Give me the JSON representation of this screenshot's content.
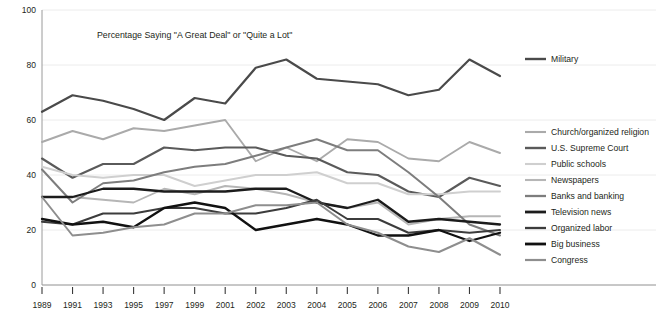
{
  "chart_data": {
    "type": "line",
    "title": "Percentage Saying \"A Great Deal\" or \"Quite a Lot\"",
    "xlabel": "",
    "ylabel": "",
    "ylim": [
      0,
      100
    ],
    "yticks": [
      0,
      20,
      40,
      60,
      80,
      100
    ],
    "grid": true,
    "legend_position": "right",
    "x": [
      "1989",
      "1991",
      "1993",
      "1995",
      "1997",
      "1999",
      "2001",
      "2002",
      "2003",
      "2004",
      "2005",
      "2006",
      "2007",
      "2008",
      "2009",
      "2010"
    ],
    "categories": [
      "1989",
      "1991",
      "1993",
      "1995",
      "1997",
      "1999",
      "2001",
      "2002",
      "2003",
      "2004",
      "2005",
      "2006",
      "2007",
      "2008",
      "2009",
      "2010"
    ],
    "series": [
      {
        "name": "Military",
        "color": "#4a4a4a",
        "width": 2.2,
        "values": [
          63,
          69,
          67,
          64,
          60,
          68,
          66,
          79,
          82,
          75,
          74,
          73,
          69,
          71,
          82,
          76
        ]
      },
      {
        "name": "Church/organized religion",
        "color": "#aaaaaa",
        "width": 1.9,
        "values": [
          52,
          56,
          53,
          57,
          56,
          58,
          60,
          45,
          50,
          45,
          53,
          52,
          46,
          45,
          52,
          48
        ]
      },
      {
        "name": "U.S. Supreme Court",
        "color": "#5a5a5a",
        "width": 2.1,
        "values": [
          46,
          39,
          44,
          44,
          50,
          49,
          50,
          50,
          47,
          46,
          41,
          40,
          34,
          32,
          39,
          36
        ]
      },
      {
        "name": "Public schools",
        "color": "#cfcfcf",
        "width": 1.9,
        "values": [
          43,
          40,
          39,
          40,
          40,
          36,
          38,
          40,
          40,
          41,
          37,
          37,
          33,
          33,
          34,
          34
        ]
      },
      {
        "name": "Newspapers",
        "color": "#b6b6b6",
        "width": 1.9,
        "values": [
          32,
          32,
          31,
          30,
          35,
          33,
          36,
          35,
          33,
          30,
          28,
          30,
          22,
          24,
          25,
          25
        ]
      },
      {
        "name": "Banks and banking",
        "color": "#7d7d7d",
        "width": 2.0,
        "values": [
          42,
          30,
          37,
          38,
          41,
          43,
          44,
          47,
          50,
          53,
          49,
          49,
          41,
          32,
          22,
          18
        ]
      },
      {
        "name": "Television news",
        "color": "#1c1c1c",
        "width": 2.3,
        "values": [
          32,
          32,
          35,
          35,
          34,
          34,
          34,
          35,
          35,
          30,
          28,
          31,
          23,
          24,
          23,
          22
        ]
      },
      {
        "name": "Organized labor",
        "color": "#3c3c3c",
        "width": 2.0,
        "values": [
          23,
          22,
          26,
          26,
          28,
          28,
          26,
          26,
          28,
          31,
          24,
          24,
          19,
          20,
          19,
          20
        ]
      },
      {
        "name": "Big business",
        "color": "#111111",
        "width": 2.3,
        "values": [
          24,
          22,
          23,
          21,
          28,
          30,
          28,
          20,
          22,
          24,
          22,
          18,
          18,
          20,
          16,
          19
        ]
      },
      {
        "name": "Congress",
        "color": "#8e8e8e",
        "width": 2.0,
        "values": [
          32,
          18,
          19,
          21,
          22,
          26,
          26,
          29,
          29,
          30,
          22,
          19,
          14,
          12,
          17,
          11
        ]
      }
    ]
  },
  "legend": {
    "items": [
      {
        "label": "Military",
        "color": "#4a4a4a",
        "width": 2.4,
        "y": 59
      },
      {
        "label": "Church/organized religion",
        "color": "#aaaaaa",
        "width": 2.1,
        "y": 132
      },
      {
        "label": "U.S. Supreme Court",
        "color": "#5a5a5a",
        "width": 2.4,
        "y": 148
      },
      {
        "label": "Public schools",
        "color": "#cfcfcf",
        "width": 2.1,
        "y": 164
      },
      {
        "label": "Newspapers",
        "color": "#b6b6b6",
        "width": 2.1,
        "y": 180
      },
      {
        "label": "Banks and banking",
        "color": "#7d7d7d",
        "width": 2.3,
        "y": 196
      },
      {
        "label": "Television news",
        "color": "#1c1c1c",
        "width": 2.8,
        "y": 212
      },
      {
        "label": "Organized labor",
        "color": "#3c3c3c",
        "width": 2.3,
        "y": 228
      },
      {
        "label": "Big business",
        "color": "#111111",
        "width": 2.8,
        "y": 244
      },
      {
        "label": "Congress",
        "color": "#8e8e8e",
        "width": 2.2,
        "y": 260
      }
    ]
  },
  "axes": {
    "y_ticks": [
      "100",
      "80",
      "60",
      "40",
      "20",
      "0"
    ],
    "x_ticks": [
      "1989",
      "1991",
      "1993",
      "1995",
      "1997",
      "1999",
      "2001",
      "2002",
      "2003",
      "2004",
      "2005",
      "2006",
      "2007",
      "2008",
      "2009",
      "2010"
    ]
  },
  "colors": {
    "background": "#ffffff",
    "grid": "#ececec",
    "axis": "#9a9a9a",
    "text": "#231f20"
  }
}
